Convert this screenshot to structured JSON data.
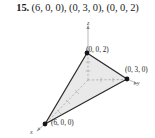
{
  "problem": {
    "number": "15.",
    "points_text": "(6, 0, 0), (0, 3, 0), (0, 0, 2)"
  },
  "figure": {
    "vertex_labels": {
      "top": "(0, 0, 2)",
      "right": "(0, 3, 0)",
      "bottom_left": "(6, 0, 0)"
    },
    "axis_labels": {
      "z": "z",
      "y": "y",
      "x": "x"
    },
    "colors": {
      "triangle_fill": "#e9e9e9",
      "triangle_stroke": "#2b2b2b",
      "axis_stroke": "#9a9a9a",
      "vertex_dot": "#161616",
      "background": "#ffffff"
    },
    "geometry": {
      "vertex_top_px": [
        87,
        37
      ],
      "vertex_right_px": [
        127,
        63
      ],
      "vertex_bottom_left_px": [
        45,
        108
      ],
      "origin_px": [
        88,
        64
      ],
      "z_axis_tip_px": [
        88,
        10
      ],
      "y_axis_tip_px": [
        135,
        67
      ],
      "x_axis_tip_px": [
        38,
        114
      ]
    }
  }
}
